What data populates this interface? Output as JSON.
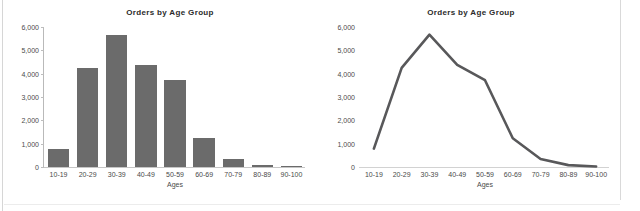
{
  "panels": [
    {
      "title": "Orders by Age Group"
    },
    {
      "title": "Orders by Age Group"
    }
  ],
  "chart_data": [
    {
      "type": "bar",
      "title": "Orders by Age Group",
      "xlabel": "Ages",
      "ylabel": "",
      "categories": [
        "10-19",
        "20-29",
        "30-39",
        "40-49",
        "50-59",
        "60-69",
        "70-79",
        "80-89",
        "90-100"
      ],
      "values": [
        790,
        4250,
        5670,
        4380,
        3720,
        1230,
        340,
        80,
        20
      ],
      "ylim": [
        0,
        6000
      ],
      "yticks": [
        0,
        1000,
        2000,
        3000,
        4000,
        5000,
        6000
      ],
      "ytick_labels": [
        "0",
        "1,000",
        "2,000",
        "3,000",
        "4,000",
        "5,000",
        "6,000"
      ],
      "grid": false,
      "legend": "none",
      "series_color": "#6b6b6b"
    },
    {
      "type": "line",
      "title": "Orders by Age Group",
      "xlabel": "Ages",
      "ylabel": "",
      "categories": [
        "10-19",
        "20-29",
        "30-39",
        "40-49",
        "50-59",
        "60-69",
        "70-79",
        "80-89",
        "90-100"
      ],
      "values": [
        790,
        4250,
        5670,
        4380,
        3720,
        1230,
        340,
        80,
        20
      ],
      "ylim": [
        0,
        6000
      ],
      "yticks": [
        0,
        1000,
        2000,
        3000,
        4000,
        5000,
        6000
      ],
      "ytick_labels": [
        "0",
        "1,000",
        "2,000",
        "3,000",
        "4,000",
        "5,000",
        "6,000"
      ],
      "grid": false,
      "legend": "none",
      "series_color": "#58585a"
    }
  ]
}
